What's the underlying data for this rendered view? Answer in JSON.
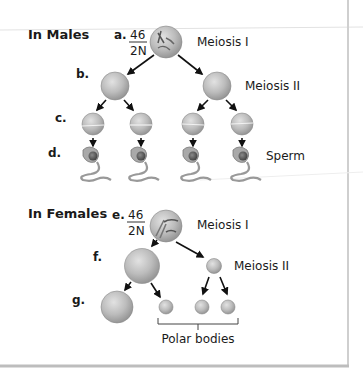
{
  "males": {
    "heading": "In Males",
    "a_label": "a.",
    "a_count": "46",
    "a_ploidy": "2N",
    "b_label": "b.",
    "c_label": "c.",
    "d_label": "d.",
    "meiosis1": "Meiosis I",
    "meiosis2": "Meiosis II",
    "product": "Sperm"
  },
  "females": {
    "heading": "In Females",
    "e_label": "e.",
    "e_count": "46",
    "e_ploidy": "2N",
    "f_label": "f.",
    "g_label": "g.",
    "meiosis1": "Meiosis I",
    "meiosis2": "Meiosis II",
    "polar": "Polar bodies"
  },
  "colors": {
    "cell_fill": "#b8b8b8",
    "cell_edge": "#8a8a8a",
    "text": "#1a1a1a",
    "border": "#c8c8c8"
  }
}
